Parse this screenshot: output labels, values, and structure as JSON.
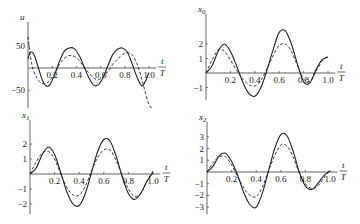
{
  "chart_data": [
    {
      "type": "line",
      "panel": "top-left",
      "ylabel": "u",
      "xlabel": "t/T",
      "x_ticks": [
        "0.2",
        "0.4",
        "0.6",
        "0.8",
        "1.0"
      ],
      "y_ticks": [
        "50",
        "-50"
      ],
      "ylim": [
        -80,
        90
      ],
      "xlim": [
        0,
        1.05
      ],
      "series": [
        {
          "name": "solid",
          "style": "solid",
          "x": [
            0,
            0.02,
            0.05,
            0.08,
            0.12,
            0.15,
            0.18,
            0.22,
            0.26,
            0.3,
            0.34,
            0.38,
            0.42,
            0.46,
            0.5,
            0.54,
            0.58,
            0.62,
            0.66,
            0.7,
            0.74,
            0.78,
            0.82,
            0.86,
            0.9,
            0.94,
            0.97,
            1.0
          ],
          "y": [
            20,
            36,
            30,
            5,
            -28,
            -40,
            -38,
            -15,
            15,
            38,
            45,
            44,
            30,
            5,
            -20,
            -38,
            -38,
            -22,
            5,
            30,
            42,
            45,
            36,
            10,
            -20,
            -40,
            -30,
            -10
          ]
        },
        {
          "name": "dashed",
          "style": "dashed",
          "x": [
            0,
            0.03,
            0.06,
            0.1,
            0.14,
            0.18,
            0.22,
            0.26,
            0.3,
            0.34,
            0.38,
            0.42,
            0.46,
            0.5,
            0.54,
            0.58,
            0.62,
            0.66,
            0.7,
            0.74,
            0.78,
            0.82,
            0.86,
            0.9,
            0.93,
            0.96,
            0.99,
            1.02
          ],
          "y": [
            70,
            10,
            -15,
            -32,
            -35,
            -28,
            -12,
            8,
            22,
            28,
            26,
            18,
            3,
            -10,
            -22,
            -26,
            -20,
            -8,
            8,
            20,
            30,
            34,
            30,
            10,
            -15,
            -45,
            -75,
            -90
          ]
        }
      ]
    },
    {
      "type": "line",
      "panel": "top-right",
      "ylabel": "x0",
      "xlabel": "t/T",
      "x_ticks": [
        "0.2",
        "0.4",
        "0.6",
        "0.8",
        "1.0"
      ],
      "y_ticks": [
        "2",
        "1",
        "-1"
      ],
      "ylim": [
        -1.7,
        3.2
      ],
      "xlim": [
        0,
        1.05
      ],
      "series": [
        {
          "name": "solid",
          "style": "solid",
          "x": [
            0,
            0.05,
            0.1,
            0.15,
            0.2,
            0.25,
            0.3,
            0.35,
            0.4,
            0.45,
            0.5,
            0.55,
            0.6,
            0.65,
            0.7,
            0.75,
            0.8,
            0.85,
            0.9,
            0.95,
            1.0
          ],
          "y": [
            0,
            0.5,
            1.5,
            2.0,
            1.5,
            0.5,
            -0.6,
            -1.4,
            -1.6,
            -1.0,
            0.2,
            1.6,
            2.8,
            2.9,
            2.0,
            0.6,
            -0.6,
            -0.7,
            0.2,
            0.9,
            1.1
          ]
        },
        {
          "name": "dashed",
          "style": "dashed",
          "x": [
            0,
            0.05,
            0.1,
            0.15,
            0.2,
            0.25,
            0.3,
            0.35,
            0.4,
            0.45,
            0.5,
            0.55,
            0.6,
            0.65,
            0.7,
            0.75,
            0.8,
            0.85,
            0.9,
            0.95,
            1.0
          ],
          "y": [
            0,
            0.9,
            1.6,
            1.5,
            0.9,
            0.2,
            -0.4,
            -0.8,
            -0.9,
            -0.5,
            0.3,
            1.2,
            1.9,
            2.0,
            1.5,
            0.5,
            -0.4,
            -0.6,
            0.1,
            0.8,
            1.2
          ]
        }
      ]
    },
    {
      "type": "line",
      "panel": "bottom-left",
      "ylabel": "x1",
      "xlabel": "t/T",
      "x_ticks": [
        "0.2",
        "0.4",
        "0.6",
        "0.8",
        "1.0"
      ],
      "y_ticks": [
        "2",
        "1",
        "-1",
        "-2"
      ],
      "ylim": [
        -2.3,
        2.6
      ],
      "xlim": [
        0,
        1.05
      ],
      "series": [
        {
          "name": "solid",
          "style": "solid",
          "x": [
            0,
            0.05,
            0.1,
            0.15,
            0.2,
            0.25,
            0.3,
            0.35,
            0.4,
            0.45,
            0.5,
            0.55,
            0.6,
            0.65,
            0.7,
            0.75,
            0.8,
            0.85,
            0.9,
            0.95,
            1.0
          ],
          "y": [
            0,
            0.4,
            1.3,
            1.8,
            1.3,
            0.1,
            -1.2,
            -2.0,
            -2.1,
            -1.3,
            0.1,
            1.5,
            2.3,
            2.2,
            1.2,
            -0.2,
            -1.3,
            -1.7,
            -1.3,
            -0.5,
            0.1
          ]
        },
        {
          "name": "dashed",
          "style": "dashed",
          "x": [
            0,
            0.05,
            0.1,
            0.15,
            0.2,
            0.25,
            0.3,
            0.35,
            0.4,
            0.45,
            0.5,
            0.55,
            0.6,
            0.65,
            0.7,
            0.75,
            0.8,
            0.85,
            0.9,
            0.95,
            1.0
          ],
          "y": [
            0,
            0.8,
            1.4,
            1.5,
            1.0,
            0.0,
            -0.9,
            -1.4,
            -1.4,
            -0.8,
            0.2,
            1.1,
            1.6,
            1.6,
            0.9,
            -0.1,
            -1.0,
            -1.5,
            -1.3,
            -0.5,
            0.2
          ]
        }
      ]
    },
    {
      "type": "line",
      "panel": "bottom-right",
      "ylabel": "x2",
      "xlabel": "t/T",
      "x_ticks": [
        "0.2",
        "0.4",
        "0.6",
        "0.8",
        "1.0"
      ],
      "y_ticks": [
        "3",
        "2",
        "1",
        "-1",
        "-2",
        "-3"
      ],
      "ylim": [
        -3.3,
        3.6
      ],
      "xlim": [
        0,
        1.05
      ],
      "series": [
        {
          "name": "solid",
          "style": "solid",
          "x": [
            0,
            0.05,
            0.1,
            0.15,
            0.2,
            0.25,
            0.3,
            0.35,
            0.4,
            0.45,
            0.5,
            0.55,
            0.6,
            0.65,
            0.7,
            0.75,
            0.8,
            0.85,
            0.9,
            0.95,
            1.0
          ],
          "y": [
            0,
            0.5,
            1.4,
            1.6,
            0.9,
            -0.3,
            -1.8,
            -2.8,
            -3.0,
            -1.8,
            0.1,
            2.0,
            3.2,
            3.1,
            1.8,
            0.0,
            -1.2,
            -1.5,
            -1.0,
            -0.3,
            0.1
          ]
        },
        {
          "name": "dashed",
          "style": "dashed",
          "x": [
            0,
            0.05,
            0.1,
            0.15,
            0.2,
            0.25,
            0.3,
            0.35,
            0.4,
            0.45,
            0.5,
            0.55,
            0.6,
            0.65,
            0.7,
            0.75,
            0.8,
            0.85,
            0.9,
            0.95,
            1.0
          ],
          "y": [
            0,
            0.8,
            1.3,
            1.3,
            0.6,
            -0.4,
            -1.4,
            -2.0,
            -2.1,
            -1.3,
            0.1,
            1.4,
            2.3,
            2.2,
            1.3,
            -0.1,
            -1.0,
            -1.4,
            -1.2,
            -0.5,
            0.1
          ]
        }
      ]
    }
  ],
  "panels": [
    {
      "ylabel": "u",
      "ylabel_sub": "",
      "t_num": "t",
      "t_den": "T"
    },
    {
      "ylabel": "x",
      "ylabel_sub": "0",
      "t_num": "t",
      "t_den": "T"
    },
    {
      "ylabel": "x",
      "ylabel_sub": "1",
      "t_num": "t",
      "t_den": "T"
    },
    {
      "ylabel": "x",
      "ylabel_sub": "2",
      "t_num": "t",
      "t_den": "T"
    }
  ]
}
